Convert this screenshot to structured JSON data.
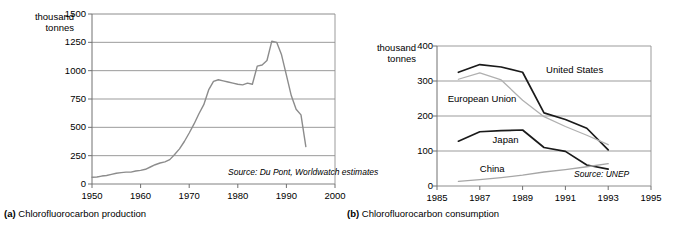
{
  "figure": {
    "panels": [
      {
        "id": "a",
        "caption_marker": "(a)",
        "caption_text": "Chlorofluorocarbon production",
        "unit_label": "thousand\ntonnes",
        "source": "Source: Du Pont, Worldwatch estimates"
      },
      {
        "id": "b",
        "caption_marker": "(b)",
        "caption_text": "Chlorofluorocarbon consumption",
        "unit_label": "thousand\ntonnes",
        "source": "Source: UNEP"
      }
    ]
  },
  "chart_data": [
    {
      "type": "line",
      "id": "cfc-production",
      "title": "Chlorofluorocarbon production",
      "xlabel": "",
      "ylabel": "thousand tonnes",
      "xlim": [
        1950,
        2000
      ],
      "ylim": [
        0,
        1500
      ],
      "xticks": [
        1950,
        1960,
        1970,
        1980,
        1990,
        2000
      ],
      "yticks": [
        0,
        250,
        500,
        750,
        1000,
        1250,
        1500
      ],
      "grid": "horizontal",
      "legend": "none",
      "annotations": [
        "Source: Du Pont, Worldwatch estimates"
      ],
      "series": [
        {
          "name": "World CFC production",
          "color": "#8c8c8c",
          "x": [
            1950,
            1951,
            1952,
            1953,
            1954,
            1955,
            1956,
            1957,
            1958,
            1959,
            1960,
            1961,
            1962,
            1963,
            1964,
            1965,
            1966,
            1967,
            1968,
            1969,
            1970,
            1971,
            1972,
            1973,
            1974,
            1975,
            1976,
            1977,
            1978,
            1979,
            1980,
            1981,
            1982,
            1983,
            1984,
            1985,
            1986,
            1987,
            1988,
            1989,
            1990,
            1991,
            1992,
            1993,
            1994
          ],
          "values": [
            60,
            62,
            70,
            75,
            85,
            95,
            100,
            105,
            105,
            115,
            120,
            130,
            150,
            170,
            185,
            195,
            215,
            260,
            310,
            375,
            450,
            530,
            620,
            700,
            830,
            905,
            920,
            910,
            900,
            890,
            880,
            875,
            890,
            880,
            1040,
            1050,
            1090,
            1260,
            1250,
            1140,
            960,
            780,
            660,
            610,
            330
          ]
        }
      ]
    },
    {
      "type": "line",
      "id": "cfc-consumption",
      "title": "Chlorofluorocarbon consumption",
      "xlabel": "",
      "ylabel": "thousand tonnes",
      "xlim": [
        1985,
        1995
      ],
      "ylim": [
        0,
        400
      ],
      "xticks": [
        1985,
        1987,
        1989,
        1991,
        1993,
        1995
      ],
      "yticks": [
        0,
        100,
        200,
        300,
        400
      ],
      "grid": "horizontal",
      "legend": "inline-labels",
      "annotations": [
        "Source: UNEP"
      ],
      "series": [
        {
          "name": "United States",
          "color": "#1a1a1a",
          "label_x": 1990.1,
          "label_y": 333,
          "x": [
            1986,
            1987,
            1988,
            1989,
            1990,
            1991,
            1992,
            1993
          ],
          "values": [
            325,
            347,
            340,
            325,
            209,
            190,
            165,
            103
          ]
        },
        {
          "name": "European Union",
          "color": "#b0b0b0",
          "label_x": 1985.5,
          "label_y": 248,
          "x": [
            1986,
            1987,
            1988,
            1989,
            1990,
            1991,
            1992,
            1993
          ],
          "values": [
            305,
            323,
            303,
            245,
            198,
            170,
            145,
            118
          ]
        },
        {
          "name": "Japan",
          "color": "#1a1a1a",
          "label_x": 1987.6,
          "label_y": 132,
          "x": [
            1986,
            1987,
            1988,
            1989,
            1990,
            1991,
            1992,
            1993
          ],
          "values": [
            128,
            155,
            158,
            160,
            110,
            99,
            60,
            48
          ]
        },
        {
          "name": "China",
          "color": "#a6a6a6",
          "label_x": 1987.0,
          "label_y": 48,
          "x": [
            1986,
            1987,
            1988,
            1989,
            1990,
            1991,
            1992,
            1993
          ],
          "values": [
            13,
            18,
            24,
            31,
            40,
            47,
            55,
            64
          ]
        }
      ]
    }
  ],
  "panel_a": {
    "unit_line1": "thousand",
    "unit_line2": "tonnes",
    "ytick_labels": [
      "1500",
      "1250",
      "1000",
      "750",
      "500",
      "250",
      "0"
    ],
    "xtick_labels": [
      "1950",
      "1960",
      "1970",
      "1980",
      "1990",
      "2000"
    ],
    "source": "Source: Du Pont, Worldwatch estimates",
    "caption_marker": "(a)",
    "caption_text": "Chlorofluorocarbon production"
  },
  "panel_b": {
    "unit_line1": "thousand",
    "unit_line2": "tonnes",
    "ytick_labels": [
      "400",
      "300",
      "200",
      "100",
      "0"
    ],
    "xtick_labels": [
      "1985",
      "1987",
      "1989",
      "1991",
      "1993",
      "1995"
    ],
    "series_labels": [
      "United States",
      "European Union",
      "Japan",
      "China"
    ],
    "source": "Source: UNEP",
    "caption_marker": "(b)",
    "caption_text": "Chlorofluorocarbon consumption"
  }
}
